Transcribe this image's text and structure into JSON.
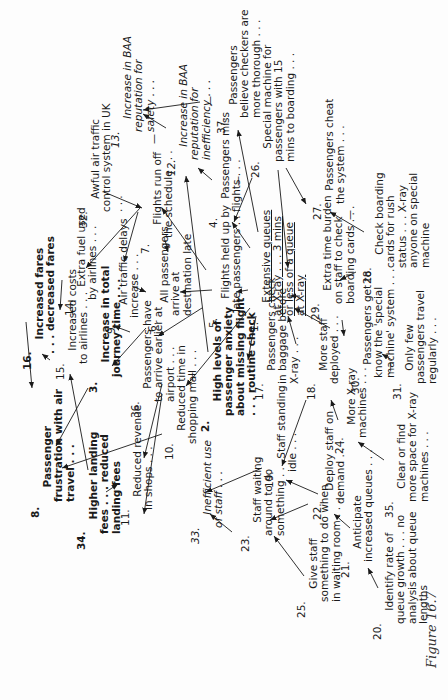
{
  "figure": {
    "caption": "Figure 16.7"
  },
  "nodes": [
    {
      "id": "1",
      "num": "1.",
      "text": "Extensive queues\nat X-ray . . . 3 mins\nor less of a queue\nat X-ray",
      "style": "under"
    },
    {
      "id": "2",
      "num": "2.",
      "text": "High levels of\npassenger anxiety\nabout missing flight\n. . . routine check",
      "style": "bold"
    },
    {
      "id": "3",
      "num": "3.",
      "text": "Increase in total\njourney time . . .",
      "style": "bold"
    },
    {
      "id": "4",
      "num": "4.",
      "text": "Passengers miss\nflights . . .",
      "style": ""
    },
    {
      "id": "5",
      "num": "5.",
      "text": "Flights held up by\nlate passengers . . .",
      "style": ""
    },
    {
      "id": "6",
      "num": "6.",
      "text": "All passengers\narrive at\ndestination late",
      "style": ""
    },
    {
      "id": "7",
      "num": "7.",
      "text": "Flights run off\nthe schedule . . .",
      "style": ""
    },
    {
      "id": "8",
      "num": "8.",
      "text": "Passenger\nfrustration with air\ntravel . . .",
      "style": "bold"
    },
    {
      "id": "9",
      "num": "9.",
      "text": "Air traffic delays\nincrease . . .",
      "style": ""
    },
    {
      "id": "10",
      "num": "10.",
      "text": "Reduced time in\nshopping mall . . .",
      "style": ""
    },
    {
      "id": "11",
      "num": "11.",
      "text": "Reduced revenue\nin shops . . .",
      "style": ""
    },
    {
      "id": "12",
      "num": "12.",
      "text": "Increase in BAA\nreputation for\ninefficiency . . .",
      "style": "italic"
    },
    {
      "id": "13",
      "num": "13.",
      "text": "Increase in BAA\nreputation for\nsafety . . .",
      "style": "italic"
    },
    {
      "id": "14",
      "num": "14.",
      "text": "Extra fuel used\nby airlines . . .",
      "style": ""
    },
    {
      "id": "15",
      "num": "15.",
      "text": "Increased costs\nto airlines . . .",
      "style": ""
    },
    {
      "id": "16",
      "num": "16.",
      "text": "Increased fares\n. . . decreased fares",
      "style": "bold"
    },
    {
      "id": "17",
      "num": "17.",
      "text": "Passengers check\nin baggage before\nX-ray . . .",
      "style": ""
    },
    {
      "id": "18",
      "num": "18.",
      "text": "More staff\ndeployed . . .",
      "style": ""
    },
    {
      "id": "19",
      "num": "19.",
      "text": "Staff standing\nidle . . .",
      "style": ""
    },
    {
      "id": "20",
      "num": "20.",
      "text": "Identify rate of\nqueue growth . . . no\nanalysis about queue\nlengths",
      "style": ""
    },
    {
      "id": "21",
      "num": "21.",
      "text": "Anticipate\nincreased queues . . .",
      "style": ""
    },
    {
      "id": "22",
      "num": "22.",
      "text": "Deploy staff on\ndemand . . .",
      "style": ""
    },
    {
      "id": "23",
      "num": "23.",
      "text": "Staff waiting\naround to do\nsomething . . .",
      "style": ""
    },
    {
      "id": "24",
      "num": "24.",
      "text": "More X-ray\nmachines . . .",
      "style": ""
    },
    {
      "id": "25",
      "num": "25.",
      "text": "Give staff\nsomething to do when\nin waiting room . . .",
      "style": ""
    },
    {
      "id": "26",
      "num": "26.",
      "text": "Special machine for\npassengers with 15\nmins to boarding . . .",
      "style": ""
    },
    {
      "id": "27",
      "num": "27.",
      "text": "Passengers cheat\nthe system . . .",
      "style": ""
    },
    {
      "id": "28",
      "num": "28.",
      "text": "Check boarding\ncards for rush\nstatus . . . X-ray\nanyone on special\nmachine",
      "style": ""
    },
    {
      "id": "29",
      "num": "29.",
      "text": "Extra time burden\non staff to check\nboarding cards . . .",
      "style": ""
    },
    {
      "id": "30",
      "num": "30.",
      "text": "Passengers get to\nknow the 'special\nmachine' system . . .",
      "style": ""
    },
    {
      "id": "31",
      "num": "31.",
      "text": "Only few\npassengers travel\nregularly . . .",
      "style": ""
    },
    {
      "id": "32",
      "num": "32.",
      "text": "Awful air traffic\ncontrol system in UK\n. . .",
      "style": ""
    },
    {
      "id": "33",
      "num": "33.",
      "text": "Inefficient use\nof staff . . .",
      "style": "italic"
    },
    {
      "id": "34",
      "num": "34.",
      "text": "Higher landing\nfees . . . reduced\nlanding fees",
      "style": "bold-light"
    },
    {
      "id": "35",
      "num": "35.",
      "text": "Clear or find\nmore space for X-ray\nmachines . . .",
      "style": ""
    },
    {
      "id": "36",
      "num": "36.",
      "text": "Passengers have\nto arrive earlier at\nairport . . .",
      "style": ""
    },
    {
      "id": "37",
      "num": "37.",
      "text": "Passengers\nbelieve checkers are\nmore thorough . . .",
      "style": ""
    }
  ],
  "links": [
    {
      "from": "1",
      "to": "4",
      "sign": "+"
    },
    {
      "from": "1",
      "to": "5",
      "sign": "+"
    },
    {
      "from": "1",
      "to": "37",
      "sign": "+"
    },
    {
      "from": "1",
      "to": "2",
      "sign": "+"
    },
    {
      "from": "1",
      "to": "17",
      "sign": "+"
    },
    {
      "from": "5",
      "to": "6",
      "sign": "+"
    },
    {
      "from": "5",
      "to": "7",
      "sign": "+"
    },
    {
      "from": "5",
      "to": "36",
      "sign": "+"
    },
    {
      "from": "7",
      "to": "6",
      "sign": "+"
    },
    {
      "from": "7",
      "to": "9",
      "sign": "+"
    },
    {
      "from": "7",
      "to": "14",
      "sign": "+"
    },
    {
      "from": "32",
      "to": "7",
      "sign": "+"
    },
    {
      "from": "9",
      "to": "6",
      "sign": "+"
    },
    {
      "from": "6",
      "to": "3",
      "sign": "+"
    },
    {
      "from": "36",
      "to": "3",
      "sign": "+"
    },
    {
      "from": "36",
      "to": "11",
      "sign": "+"
    },
    {
      "from": "4",
      "to": "12",
      "sign": "+"
    },
    {
      "from": "12",
      "to": "13",
      "sign": "-"
    },
    {
      "from": "37",
      "to": "13",
      "sign": "-"
    },
    {
      "from": "26",
      "to": "4",
      "sign": "-"
    },
    {
      "from": "26",
      "to": "27",
      "sign": "+"
    },
    {
      "from": "26",
      "to": "1",
      "sign": "+"
    },
    {
      "from": "28",
      "to": "27",
      "sign": "-"
    },
    {
      "from": "28",
      "to": "29",
      "sign": "+"
    },
    {
      "from": "29",
      "to": "1",
      "sign": "+"
    },
    {
      "from": "30",
      "to": "1",
      "sign": "+"
    },
    {
      "from": "29",
      "to": "30",
      "sign": "+"
    },
    {
      "from": "31",
      "to": "30",
      "sign": "-"
    },
    {
      "from": "18",
      "to": "1",
      "sign": "+"
    },
    {
      "from": "18",
      "to": "19",
      "sign": "+"
    },
    {
      "from": "24",
      "to": "18",
      "sign": "+"
    },
    {
      "from": "35",
      "to": "24",
      "sign": "+"
    },
    {
      "from": "19",
      "to": "33",
      "sign": "+"
    },
    {
      "from": "22",
      "to": "19",
      "sign": "+"
    },
    {
      "from": "22",
      "to": "23",
      "sign": "+"
    },
    {
      "from": "21",
      "to": "22",
      "sign": "+"
    },
    {
      "from": "20",
      "to": "21",
      "sign": "+"
    },
    {
      "from": "23",
      "to": "33",
      "sign": "+"
    },
    {
      "from": "25",
      "to": "23",
      "sign": "+"
    },
    {
      "from": "14",
      "to": "15",
      "sign": "+"
    },
    {
      "from": "15",
      "to": "16",
      "sign": "+"
    },
    {
      "from": "16",
      "to": "8",
      "sign": "+"
    },
    {
      "from": "3",
      "to": "8",
      "sign": "+"
    },
    {
      "from": "10",
      "to": "8",
      "sign": "+"
    },
    {
      "from": "10",
      "to": "11",
      "sign": "+"
    },
    {
      "from": "34",
      "to": "15",
      "sign": "+"
    },
    {
      "from": "2",
      "to": "10",
      "sign": "-"
    },
    {
      "from": "2",
      "to": "12",
      "sign": "+"
    },
    {
      "from": "34",
      "to": "11",
      "sign": "+"
    }
  ]
}
